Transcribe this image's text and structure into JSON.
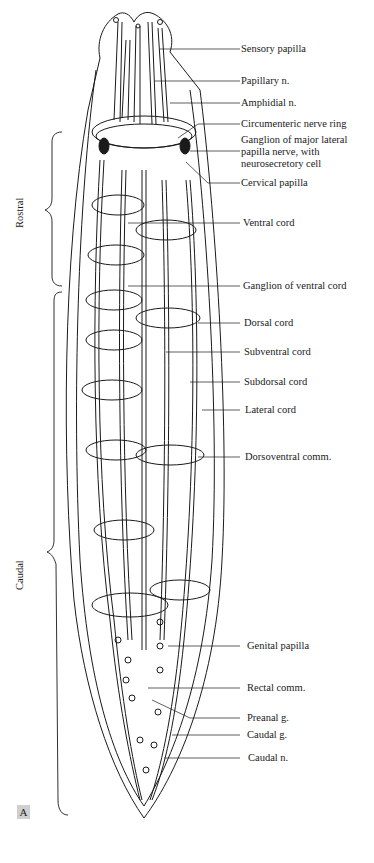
{
  "figure": {
    "panel_letter": "A",
    "regions": [
      {
        "label": "Rostral"
      },
      {
        "label": "Caudal"
      }
    ],
    "labels": [
      {
        "text": "Sensory papilla"
      },
      {
        "text": "Papillary n."
      },
      {
        "text": "Amphidial n."
      },
      {
        "text": "Circumenteric nerve ring"
      },
      {
        "text": "Ganglion of major lateral papilla nerve, with neurosecretory cell"
      },
      {
        "text": "Cervical papilla"
      },
      {
        "text": "Ventral cord"
      },
      {
        "text": "Ganglion of ventral cord"
      },
      {
        "text": "Dorsal cord"
      },
      {
        "text": "Subventral cord"
      },
      {
        "text": "Subdorsal cord"
      },
      {
        "text": "Lateral cord"
      },
      {
        "text": "Dorsoventral comm."
      },
      {
        "text": "Genital papilla"
      },
      {
        "text": "Rectal comm."
      },
      {
        "text": "Preanal g."
      },
      {
        "text": "Caudal g."
      },
      {
        "text": "Caudal n."
      }
    ],
    "colors": {
      "line": "#1a1a1a",
      "panel_badge": "#cfcfcf",
      "background": "#ffffff"
    }
  }
}
